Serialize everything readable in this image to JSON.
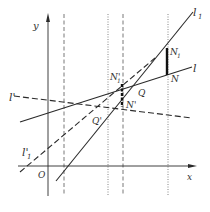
{
  "figure": {
    "axes": {
      "x_label": "x",
      "y_label": "y",
      "origin_label": "O"
    },
    "lines": {
      "l1": "l",
      "l1_sub": "1",
      "l": "l",
      "l_prime": "l'",
      "l1_prime": "l'",
      "l1_prime_sub": "1"
    },
    "points": {
      "N1": "N",
      "N1_sub": "1",
      "N": "N",
      "N1_prime": "N'",
      "N1_prime_sub": "1",
      "N_prime": "N'",
      "Q": "Q",
      "Q_prime": "Q'"
    },
    "colors": {
      "ink": "#2a2a2a",
      "background": "#ffffff"
    }
  }
}
